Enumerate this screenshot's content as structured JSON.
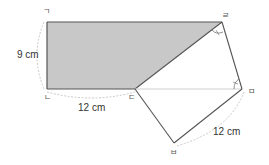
{
  "figure": {
    "vertices": {
      "g": "ㄱ",
      "n": "ㄴ",
      "d": "ㄷ",
      "r": "ㄹ",
      "m": "ㅁ",
      "b": "ㅂ"
    },
    "dimensions": {
      "left_side": "9 cm",
      "bottom_side": "12 cm",
      "right_side": "12 cm"
    },
    "colors": {
      "shade": "#c8c8c8",
      "stroke": "#555555",
      "dim_arc": "#bbbbbb"
    }
  }
}
